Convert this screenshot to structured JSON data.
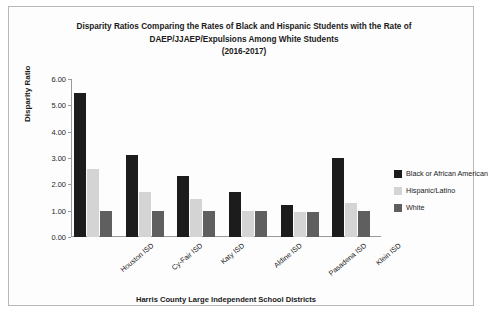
{
  "chart_data": {
    "type": "bar",
    "title_lines": [
      "Disparity Ratios Comparing the Rates of Black and Hispanic Students with the Rate of",
      "DAEP/JJAEP/Expulsions Among White Students",
      "(2016-2017)"
    ],
    "title": "Disparity Ratios Comparing the Rates of Black and Hispanic Students with the Rate of DAEP/JJAEP/Expulsions Among White Students (2016-2017)",
    "xlabel": "Harris County Large Independent School Districts",
    "ylabel": "Disparity Ratio",
    "categories": [
      "Houston ISD",
      "Cy-Fair ISD",
      "Katy ISD",
      "Aldine ISD",
      "Pasadena ISD",
      "Klein ISD"
    ],
    "series": [
      {
        "name": "Black or African American",
        "color": "#1c1c1c",
        "values": [
          5.45,
          3.1,
          2.3,
          1.7,
          1.2,
          3.0
        ]
      },
      {
        "name": "Hispanic/Latino",
        "color": "#d4d4d4",
        "values": [
          2.6,
          1.7,
          1.45,
          1.0,
          0.95,
          1.3
        ]
      },
      {
        "name": "White",
        "color": "#5f5f5f",
        "values": [
          1.0,
          1.0,
          1.0,
          1.0,
          0.95,
          1.0
        ]
      }
    ],
    "yticks": [
      "0.00",
      "1.00",
      "2.00",
      "3.00",
      "4.00",
      "5.00",
      "6.00"
    ],
    "ylim": [
      0,
      6
    ],
    "grid": false,
    "legend_position": "right"
  }
}
